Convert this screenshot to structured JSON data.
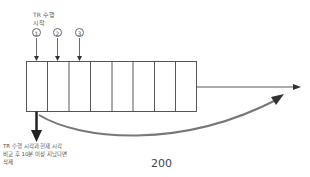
{
  "diagram": {
    "top_label": [
      "TR 수행",
      "시작"
    ],
    "markers": [
      "1",
      "2",
      "3"
    ],
    "cell_count": 8,
    "bottom_label": [
      "TR 수행 시각과 현재 시각",
      "비교 후 10분 이상 지났다면",
      "삭제"
    ],
    "figure_number": "200",
    "colors": {
      "line": "#444444",
      "curve": "#777777",
      "text": "#555555"
    }
  }
}
